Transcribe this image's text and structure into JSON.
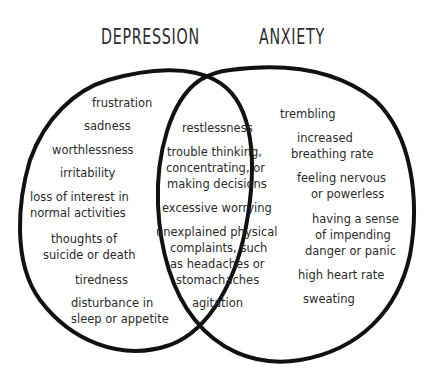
{
  "titles": {
    "left": "DEPRESSION",
    "right": "ANXIETY"
  },
  "colors": {
    "stroke": "#111111",
    "text": "#2b2b2b",
    "background": "#ffffff"
  },
  "depression_only": [
    "frustration",
    "sadness",
    "worthlessness",
    "irritability",
    "loss of interest in",
    "normal activities",
    "thoughts of",
    "suicide or death",
    "tiredness",
    "disturbance in",
    "sleep or appetite"
  ],
  "overlap": [
    "restlessness",
    "trouble thinking,",
    "concentrating, or",
    "making decisions",
    "excessive worrying",
    "unexplained physical",
    "complaints, such",
    "as headaches or",
    "stomachaches",
    "agitation"
  ],
  "anxiety_only": [
    "trembling",
    "increased",
    "breathing rate",
    "feeling nervous",
    "or powerless",
    "having a sense",
    "of impending",
    "danger or panic",
    "high heart rate",
    "sweating"
  ]
}
